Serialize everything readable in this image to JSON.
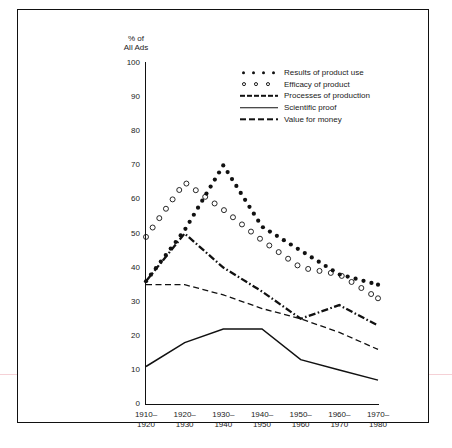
{
  "axis": {
    "y_title_line1": "% of",
    "y_title_line2": "All Ads",
    "y_ticks": [
      100,
      90,
      80,
      70,
      60,
      50,
      40,
      30,
      20,
      10,
      0
    ]
  },
  "legend": [
    {
      "label": "Results of product use",
      "key": "dots"
    },
    {
      "label": "Efficacy of product",
      "key": "circles"
    },
    {
      "label": "Processes of production",
      "key": "dashdot-thick"
    },
    {
      "label": "Scientific proof",
      "key": "solid"
    },
    {
      "label": "Value for money",
      "key": "dashed"
    }
  ],
  "chart_data": {
    "type": "line",
    "title": "",
    "xlabel": "",
    "ylabel": "% of All Ads",
    "ylim": [
      0,
      100
    ],
    "ytick_step": 10,
    "grid": false,
    "legend_position": "top-right-inside",
    "categories": [
      "1910–\n1920",
      "1920–\n1930",
      "1930–\n1940",
      "1940–\n1950",
      "1950–\n1960",
      "1960–\n1970",
      "1970–\n1980"
    ],
    "category_labels": [
      {
        "top": "1910–",
        "bottom": "1920"
      },
      {
        "top": "1920–",
        "bottom": "1930"
      },
      {
        "top": "1930–",
        "bottom": "1940"
      },
      {
        "top": "1940–",
        "bottom": "1950"
      },
      {
        "top": "1950–",
        "bottom": "1960"
      },
      {
        "top": "1960–",
        "bottom": "1970"
      },
      {
        "top": "1970–",
        "bottom": "1980"
      }
    ],
    "series": [
      {
        "name": "Results of product use",
        "style": "dotted-filled",
        "values": [
          36,
          51,
          70,
          52,
          45,
          38,
          35
        ]
      },
      {
        "name": "Efficacy of product",
        "style": "dotted-open",
        "values": [
          49,
          65,
          57,
          48,
          40,
          38,
          31
        ]
      },
      {
        "name": "Processes of production",
        "style": "dashdot-thick",
        "values": [
          36,
          50,
          40,
          33,
          25,
          29,
          23
        ]
      },
      {
        "name": "Scientific proof",
        "style": "solid",
        "values": [
          11,
          18,
          22,
          22,
          13,
          10,
          7
        ]
      },
      {
        "name": "Value for money",
        "style": "dashed",
        "values": [
          35,
          35,
          32,
          28,
          25,
          21,
          16
        ]
      }
    ]
  },
  "colors": {
    "ink": "#111111",
    "background": "#ffffff"
  }
}
